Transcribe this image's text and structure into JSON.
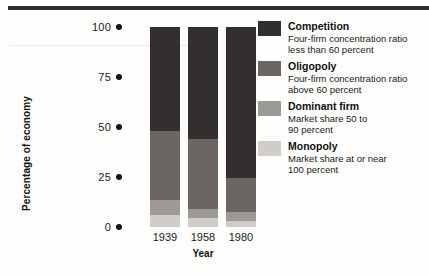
{
  "chart_data": {
    "type": "bar",
    "subtype": "stacked-bar-100",
    "title": "",
    "xlabel": "Year",
    "ylabel": "Percentage of economy",
    "categories": [
      "1939",
      "1958",
      "1980"
    ],
    "ylim": [
      0,
      100
    ],
    "yticks": [
      "0",
      "25",
      "50",
      "75",
      "100"
    ],
    "grid": false,
    "legend_position": "right",
    "series": [
      {
        "name": "Competition",
        "color": "#332f2e",
        "values": [
          52.0,
          56.0,
          75.5
        ]
      },
      {
        "name": "Oligopoly",
        "color": "#6b6664",
        "values": [
          34.5,
          35.0,
          17.0
        ]
      },
      {
        "name": "Dominant firm",
        "color": "#9d9996",
        "values": [
          7.5,
          4.5,
          4.5
        ]
      },
      {
        "name": "Monopoly",
        "color": "#d0cdc9",
        "values": [
          6.0,
          4.5,
          3.0
        ]
      }
    ]
  },
  "axis": {
    "y_title": "Percentage of economy",
    "x_title": "Year",
    "y_ticks": [
      {
        "value": 100,
        "label": "100"
      },
      {
        "value": 75,
        "label": "75"
      },
      {
        "value": 50,
        "label": "50"
      },
      {
        "value": 25,
        "label": "25"
      },
      {
        "value": 0,
        "label": "0"
      }
    ],
    "x_ticks": [
      {
        "label": "1939"
      },
      {
        "label": "1958"
      },
      {
        "label": "1980"
      }
    ]
  },
  "legend": {
    "items": [
      {
        "name": "Competition",
        "description": "Four-firm concentration ratio less than 60 percent",
        "desc_line1": "Four-firm concentration ratio",
        "desc_line2": "less than 60 percent",
        "color": "#332f2e"
      },
      {
        "name": "Oligopoly",
        "description": "Four-firm concentration ratio above 60 percent",
        "desc_line1": "Four-firm concentration ratio",
        "desc_line2": "above 60 percent",
        "color": "#6b6664"
      },
      {
        "name": "Dominant firm",
        "description": "Market share 50 to 90 percent",
        "desc_line1": "Market share 50 to",
        "desc_line2": "90 percent",
        "color": "#9d9996"
      },
      {
        "name": "Monopoly",
        "description": "Market share at or near 100 percent",
        "desc_line1": "Market share at or near",
        "desc_line2": "100 percent",
        "color": "#d0cdc9"
      }
    ]
  }
}
